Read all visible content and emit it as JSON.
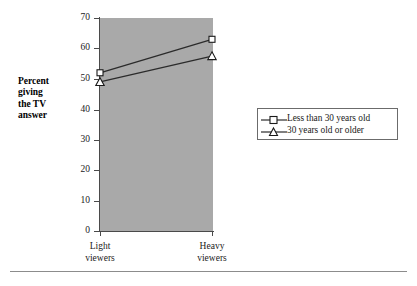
{
  "chart_data": {
    "type": "line",
    "title": "",
    "subtitle": "",
    "xlabel": "",
    "ylabel": "Percent giving the TV answer",
    "categories": [
      "Light viewers",
      "Heavy viewers"
    ],
    "series": [
      {
        "name": "Less than 30 years old",
        "marker": "open-square",
        "values": [
          52,
          63
        ]
      },
      {
        "name": "30 years old or older",
        "marker": "open-triangle",
        "values": [
          49,
          57.5
        ]
      }
    ],
    "ylim": [
      0,
      70
    ],
    "yticks": [
      0,
      10,
      20,
      30,
      40,
      50,
      60,
      70
    ],
    "ytick_labels": [
      "0",
      "10",
      "20",
      "30",
      "40",
      "50",
      "60",
      "70"
    ],
    "grid": false,
    "legend_position": "right",
    "plot_background_color": "#a9a9a9",
    "line_color": "#2b2b2b",
    "marker_fill_color": "#ffffff",
    "axis_color": "#4a4a4a"
  },
  "axis_title": {
    "lines": [
      "Percent",
      "giving",
      "the TV",
      "answer"
    ]
  },
  "x_axis": {
    "labels": [
      {
        "line1": "Light",
        "line2": "viewers"
      },
      {
        "line1": "Heavy",
        "line2": "viewers"
      }
    ]
  },
  "y_axis": {
    "labels": [
      "70",
      "60",
      "50",
      "40",
      "30",
      "20",
      "10",
      "0"
    ]
  },
  "legend": {
    "items": [
      {
        "label": "Less than 30 years old",
        "marker": "open-square"
      },
      {
        "label": "30 years old or older",
        "marker": "open-triangle"
      }
    ]
  }
}
